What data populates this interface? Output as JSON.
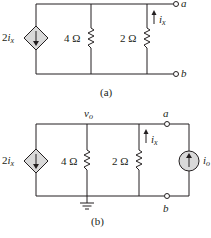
{
  "circuit_a": {
    "caption": "(a)",
    "dependent_source": {
      "coef": "2",
      "var": "i",
      "sub": "x"
    },
    "resistor_1": "4 Ω",
    "resistor_2": "2 Ω",
    "current_label": {
      "var": "i",
      "sub": "x"
    },
    "terminal_a": "a",
    "terminal_b": "b"
  },
  "circuit_b": {
    "caption": "(b)",
    "node_voltage": {
      "var": "v",
      "sub": "o"
    },
    "dependent_source": {
      "coef": "2",
      "var": "i",
      "sub": "x"
    },
    "resistor_1": "4 Ω",
    "resistor_2": "2 Ω",
    "current_label": {
      "var": "i",
      "sub": "x"
    },
    "terminal_a": "a",
    "terminal_b": "b",
    "test_source": {
      "var": "i",
      "sub": "o"
    }
  },
  "colors": {
    "wire": "#231f20",
    "source_fill": "#d9d9d9"
  }
}
